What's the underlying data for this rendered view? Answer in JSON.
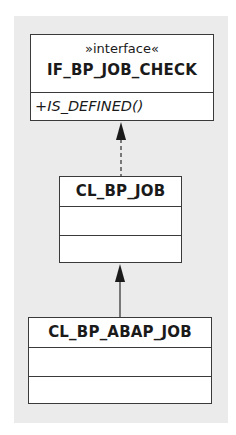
{
  "diagram": {
    "type": "uml-class-diagram",
    "background_color": "#ebebeb",
    "classes": [
      {
        "id": "if_bp_job_check",
        "stereotype": "»interface«",
        "name": "IF_BP_JOB_CHECK",
        "attributes": [],
        "operations": [
          "+IS_DEFINED()"
        ]
      },
      {
        "id": "cl_bp_job",
        "name": "CL_BP_JOB",
        "attributes": [],
        "operations": []
      },
      {
        "id": "cl_bp_abap_job",
        "name": "CL_BP_ABAP_JOB",
        "attributes": [],
        "operations": []
      }
    ],
    "relations": [
      {
        "from": "cl_bp_job",
        "to": "if_bp_job_check",
        "kind": "realization",
        "line": "dashed"
      },
      {
        "from": "cl_bp_abap_job",
        "to": "cl_bp_job",
        "kind": "inheritance",
        "line": "solid"
      }
    ]
  }
}
